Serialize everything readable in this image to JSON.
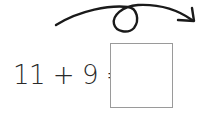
{
  "problem": {
    "equation": "11 + 9 =",
    "answer": ""
  },
  "arrow": {
    "icon": "loop-arrow-icon",
    "color": "#1a1a1a"
  }
}
